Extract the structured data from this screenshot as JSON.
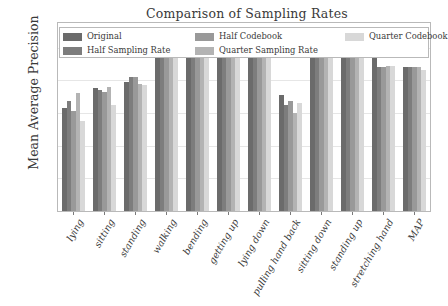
{
  "chart_data": {
    "type": "bar",
    "title": "Comparison of Sampling Rates",
    "xlabel": "",
    "ylabel": "Mean Average Precision",
    "ylim": [
      0.0,
      1.15
    ],
    "yticks": [
      "0.0",
      "0.2",
      "0.4",
      "0.6",
      "0.8",
      "1.0"
    ],
    "ytick_values": [
      0.0,
      0.2,
      0.4,
      0.6,
      0.8,
      1.0
    ],
    "grid": true,
    "legend_position": "upper center (inside axes)",
    "categories": [
      "lying",
      "sitting",
      "standing",
      "walking",
      "bending",
      "getting up",
      "lying down",
      "pulling hand back",
      "sitting down",
      "standing up",
      "stretching hand",
      "MAP"
    ],
    "series": [
      {
        "name": "Original",
        "color": "#6b6b6b",
        "values": [
          0.63,
          0.75,
          0.79,
          0.97,
          0.99,
          0.98,
          0.97,
          0.71,
          0.98,
          0.99,
          0.94,
          0.88
        ]
      },
      {
        "name": "Half Sampling Rate",
        "color": "#7d7d7d",
        "values": [
          0.67,
          0.74,
          0.82,
          0.98,
          0.99,
          0.99,
          0.99,
          0.65,
          0.99,
          0.99,
          0.88,
          0.88
        ]
      },
      {
        "name": "Half Codebook",
        "color": "#999999",
        "values": [
          0.61,
          0.73,
          0.82,
          0.97,
          0.97,
          0.99,
          0.99,
          0.67,
          0.99,
          0.99,
          0.88,
          0.88
        ]
      },
      {
        "name": "Quarter Sampling Rate",
        "color": "#b3b3b3",
        "values": [
          0.72,
          0.76,
          0.78,
          0.98,
          0.98,
          0.98,
          0.99,
          0.6,
          0.97,
          0.99,
          0.89,
          0.88
        ]
      },
      {
        "name": "Quarter Codebook",
        "color": "#d8d8d8",
        "values": [
          0.55,
          0.65,
          0.77,
          0.97,
          0.99,
          0.99,
          0.99,
          0.66,
          0.99,
          0.99,
          0.89,
          0.86
        ]
      }
    ]
  },
  "legend": {
    "entries": [
      "Original",
      "Half Codebook",
      "Quarter Codebook",
      "Half Sampling Rate",
      "Quarter Sampling Rate"
    ]
  },
  "colors": {
    "axis": "#b9b9b9",
    "grid": "#e6e6e6",
    "text": "#3a3a3a",
    "background": "#ffffff"
  }
}
